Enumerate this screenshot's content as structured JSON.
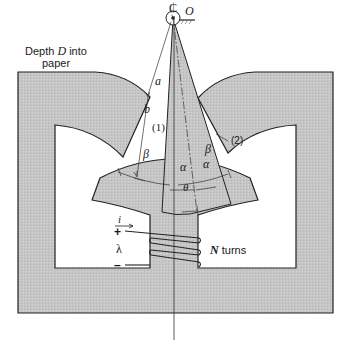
{
  "diagram": {
    "type": "electromechanical-actuator-cross-section",
    "colors": {
      "iron_fill": "#c9c9c9",
      "outline": "#222222",
      "background": "#ffffff"
    },
    "labels": {
      "centerline": "₵",
      "pivot": "O",
      "depth_line1": "Depth",
      "depth_var": "D",
      "depth_line1_tail": "into",
      "depth_line2": "paper",
      "dim_a": "a",
      "dim_b": "b",
      "gap1": "(1)",
      "gap2": "(2)",
      "beta_left": "β",
      "beta_right": "β",
      "alpha_left": "α",
      "alpha_right": "α",
      "theta": "θ",
      "current": "i",
      "plus": "+",
      "minus": "–",
      "flux_linkage": "λ",
      "turns_var": "N",
      "turns_text": "turns"
    },
    "components": [
      {
        "name": "stator-frame",
        "description": "C-shaped magnetic core with three pole pieces"
      },
      {
        "name": "rotor-wedge",
        "description": "sector-shaped rotor pivoting about O"
      },
      {
        "name": "excitation-coil",
        "description": "N-turn winding on center bottom leg"
      }
    ]
  }
}
